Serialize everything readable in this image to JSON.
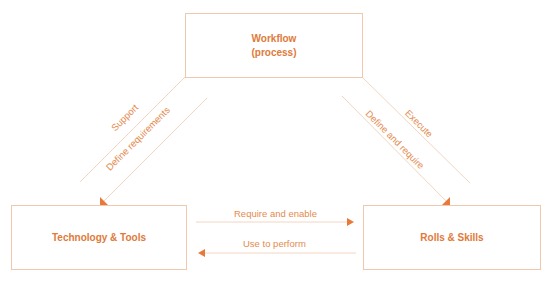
{
  "nodes": {
    "workflow": {
      "line1": "Workflow",
      "line2": "(process)"
    },
    "technology": {
      "label": "Technology & Tools"
    },
    "roles": {
      "label": "Rolls & Skills"
    }
  },
  "edges": {
    "support": "Support",
    "define_requirements": "Define requirements",
    "execute": "Execute",
    "define_and_require": "Define and require",
    "require_and_enable": "Require and enable",
    "use_to_perform": "Use to perform"
  },
  "colors": {
    "accent": "#e07a3a",
    "line": "#f2d6c4",
    "border": "#efc9ad"
  }
}
